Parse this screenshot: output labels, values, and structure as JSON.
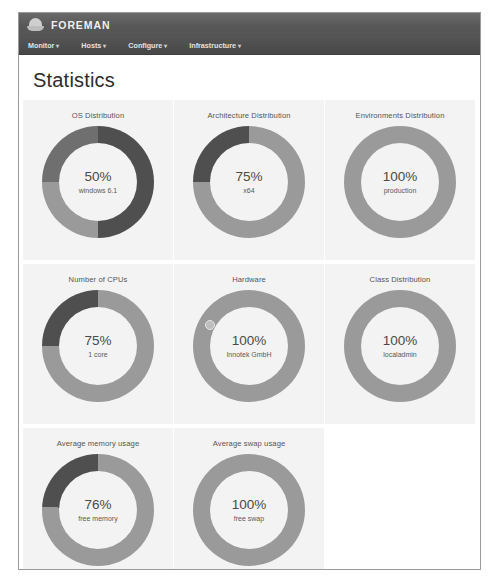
{
  "window": {
    "brand_name": "FOREMAN",
    "logo_icon": "hard-hat-icon"
  },
  "nav": {
    "items": [
      {
        "label": "Monitor",
        "caret": "▾"
      },
      {
        "label": "Hosts",
        "caret": "▾"
      },
      {
        "label": "Configure",
        "caret": "▾"
      },
      {
        "label": "Infrastructure",
        "caret": "▾"
      }
    ]
  },
  "page": {
    "title": "Statistics"
  },
  "colors": {
    "segment_light": "#9a9a9a",
    "segment_mid": "#8d8d8d",
    "segment_dark": "#4f4f4f",
    "card_background": "#f3f3f3",
    "header_background": "#5d5d5d",
    "nav_background": "#4e4e4e"
  },
  "chart_data": [
    {
      "type": "pie",
      "title": "OS Distribution",
      "center_value": "50%",
      "center_label": "windows 6.1",
      "categories": [
        "windows 6.1",
        "other a",
        "other b"
      ],
      "values": [
        50,
        25,
        25
      ],
      "colors": [
        "#4f4f4f",
        "#9a9a9a",
        "#6f6f6f"
      ],
      "legend": "none",
      "donut": true
    },
    {
      "type": "pie",
      "title": "Architecture Distribution",
      "center_value": "75%",
      "center_label": "x64",
      "categories": [
        "x64",
        "other"
      ],
      "values": [
        75,
        25
      ],
      "colors": [
        "#9a9a9a",
        "#4f4f4f"
      ],
      "legend": "none",
      "donut": true
    },
    {
      "type": "pie",
      "title": "Environments Distribution",
      "center_value": "100%",
      "center_label": "production",
      "categories": [
        "production"
      ],
      "values": [
        100
      ],
      "colors": [
        "#9a9a9a"
      ],
      "legend": "none",
      "donut": true
    },
    {
      "type": "pie",
      "title": "Number of CPUs",
      "center_value": "75%",
      "center_label": "1 core",
      "categories": [
        "1 core",
        "other"
      ],
      "values": [
        75,
        25
      ],
      "colors": [
        "#9a9a9a",
        "#4f4f4f"
      ],
      "legend": "none",
      "donut": true
    },
    {
      "type": "pie",
      "title": "Hardware",
      "center_value": "100%",
      "center_label": "Innotek GmbH",
      "categories": [
        "Innotek GmbH"
      ],
      "values": [
        100
      ],
      "colors": [
        "#9a9a9a"
      ],
      "legend": "none",
      "donut": true
    },
    {
      "type": "pie",
      "title": "Class Distribution",
      "center_value": "100%",
      "center_label": "localadmin",
      "categories": [
        "localadmin"
      ],
      "values": [
        100
      ],
      "colors": [
        "#9a9a9a"
      ],
      "legend": "none",
      "donut": true
    },
    {
      "type": "pie",
      "title": "Average memory usage",
      "center_value": "76%",
      "center_label": "free memory",
      "categories": [
        "free memory",
        "used memory"
      ],
      "values": [
        76,
        24
      ],
      "colors": [
        "#9a9a9a",
        "#4f4f4f"
      ],
      "legend": "none",
      "donut": true
    },
    {
      "type": "pie",
      "title": "Average swap usage",
      "center_value": "100%",
      "center_label": "free swap",
      "categories": [
        "free swap"
      ],
      "values": [
        100
      ],
      "colors": [
        "#9a9a9a"
      ],
      "legend": "none",
      "donut": true
    }
  ]
}
